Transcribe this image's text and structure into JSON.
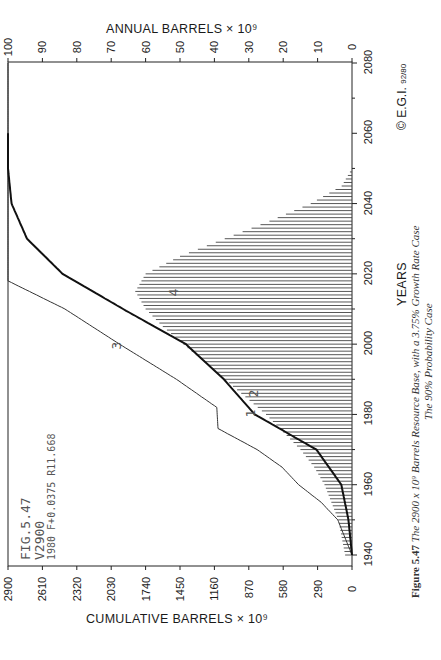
{
  "figure": {
    "plot_label_line1": "FIG.5.47",
    "plot_label_line2": "V2900",
    "plot_label_line3": "1980 F+0.0375 R11.668",
    "copyright": "© E.G.I.",
    "copyright_date": "92/80",
    "caption_prefix": "Figure 5.47",
    "caption_line1": "The 2900 x 10⁹ Barrels Resource Base, with a 3.75% Growth Rate Case",
    "caption_line2": "The 90% Probability Case"
  },
  "axes": {
    "top_title": "ANNUAL BARRELS × 10⁹",
    "bottom_title": "CUMULATIVE BARRELS × 10⁹",
    "right_title": "YEARS",
    "annual_ticks": [
      "100",
      "90",
      "80",
      "70",
      "60",
      "50",
      "40",
      "30",
      "20",
      "10",
      "0"
    ],
    "cumulative_ticks": [
      "2900",
      "2610",
      "2320",
      "2030",
      "1740",
      "1450",
      "1160",
      "870",
      "580",
      "290",
      "0"
    ],
    "year_ticks": [
      "1940",
      "1960",
      "1980",
      "2000",
      "2020",
      "2040",
      "2060",
      "2080"
    ]
  },
  "curve_labels": [
    "1",
    "2",
    "3",
    "4"
  ],
  "chart_data": {
    "type": "bar",
    "orientation": "rotated-90",
    "xlabel": "YEARS",
    "ylabel_primary": "ANNUAL BARRELS × 10^9",
    "ylabel_secondary": "CUMULATIVE BARRELS × 10^9",
    "xlim": [
      1940,
      2080
    ],
    "ylim_annual": [
      0,
      100
    ],
    "ylim_cumulative": [
      0,
      2900
    ],
    "grid": false,
    "series": [
      {
        "name": "Annual production (bars)",
        "axis": "annual",
        "x": [
          1940,
          1945,
          1950,
          1955,
          1960,
          1965,
          1970,
          1975,
          1980,
          1985,
          1990,
          1995,
          2000,
          2005,
          2010,
          2015,
          2020,
          2025,
          2030,
          2035,
          2040,
          2045,
          2050
        ],
        "values": [
          2,
          3,
          4,
          6,
          8,
          11,
          15,
          20,
          25,
          31,
          37,
          43,
          49,
          55,
          60,
          63,
          60,
          50,
          37,
          24,
          12,
          3,
          0
        ]
      },
      {
        "name": "Cumulative production (thick curve)",
        "axis": "cumulative",
        "x": [
          1940,
          1950,
          1960,
          1970,
          1980,
          1990,
          2000,
          2010,
          2020,
          2030,
          2040,
          2050,
          2060
        ],
        "values": [
          0,
          30,
          90,
          300,
          820,
          1080,
          1400,
          1930,
          2440,
          2740,
          2870,
          2900,
          2900
        ]
      },
      {
        "name": "Cumulative discoveries (thin curve, labelled 1-4)",
        "axis": "cumulative",
        "x": [
          1940,
          1950,
          1955,
          1960,
          1965,
          1970,
          1976,
          1982,
          1990,
          2000,
          2010,
          2018,
          2080
        ],
        "values": [
          0,
          120,
          260,
          450,
          590,
          800,
          1130,
          1140,
          1480,
          1960,
          2420,
          2900,
          2900
        ]
      }
    ]
  }
}
